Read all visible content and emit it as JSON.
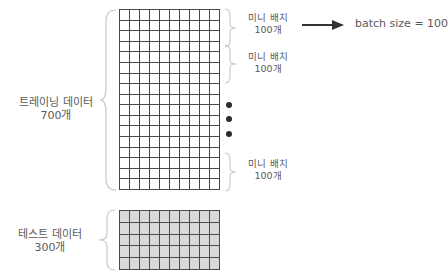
{
  "training": {
    "label_line1": "트레이닝 데이터",
    "label_line2": "700개",
    "grid": {
      "rows": 17,
      "cols": 10,
      "fill": "#ffffff",
      "line_color": "#4a4a4a"
    }
  },
  "test": {
    "label_line1": "테스트 데이터",
    "label_line2": "300개",
    "grid": {
      "rows": 5,
      "cols": 10,
      "fill": "#d9d9d9",
      "line_color": "#4a4a4a"
    }
  },
  "mini_batches": [
    {
      "line1": "미니 배치",
      "line2": "100개"
    },
    {
      "line1": "미니 배치",
      "line2": "100개"
    },
    {
      "line1": "미니 배치",
      "line2": "100개"
    }
  ],
  "ellipsis_dots": 3,
  "arrow_label": "batch size = 100",
  "colors": {
    "text": "#5a5a5a",
    "brace": "#c8c8c8",
    "arrow": "#333333",
    "dot": "#2b2b2b"
  }
}
